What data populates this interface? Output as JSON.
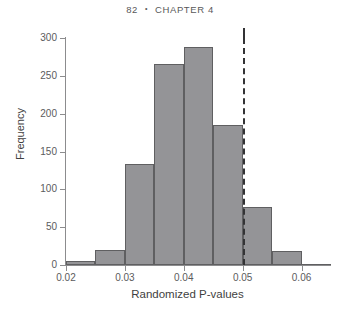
{
  "header": {
    "folio": "82",
    "separator": "•",
    "chapter": "CHAPTER 4"
  },
  "chart_data": {
    "type": "bar",
    "title": "",
    "subtitle": "",
    "xlabel": "Randomized P-values",
    "ylabel": "Frequency",
    "xlim": [
      0.02,
      0.065
    ],
    "ylim": [
      0,
      300
    ],
    "grid": false,
    "legend": "none",
    "bin_width": 0.005,
    "bin_edges": [
      0.02,
      0.025,
      0.03,
      0.035,
      0.04,
      0.045,
      0.05,
      0.055,
      0.06,
      0.065
    ],
    "categories": [
      "0.020-0.025",
      "0.025-0.030",
      "0.030-0.035",
      "0.035-0.040",
      "0.040-0.045",
      "0.045-0.050",
      "0.050-0.055",
      "0.055-0.060",
      "0.060-0.065"
    ],
    "values": [
      5,
      20,
      133,
      265,
      288,
      185,
      77,
      18,
      1
    ],
    "bar_fill_color": "#949497",
    "bar_edge_color": "#5f5f61",
    "x_ticks": [
      0.02,
      0.03,
      0.04,
      0.05,
      0.06
    ],
    "x_tick_labels": [
      "0.02",
      "0.03",
      "0.04",
      "0.05",
      "0.06"
    ],
    "y_ticks": [
      0,
      50,
      100,
      150,
      200,
      250,
      300
    ],
    "y_tick_labels": [
      "0",
      "50",
      "100",
      "150",
      "200",
      "250",
      "300"
    ],
    "annotations": [
      {
        "name": "significance-threshold",
        "type": "vline",
        "x": 0.05,
        "style": "dashed",
        "color": "#333335",
        "label": ""
      }
    ]
  }
}
